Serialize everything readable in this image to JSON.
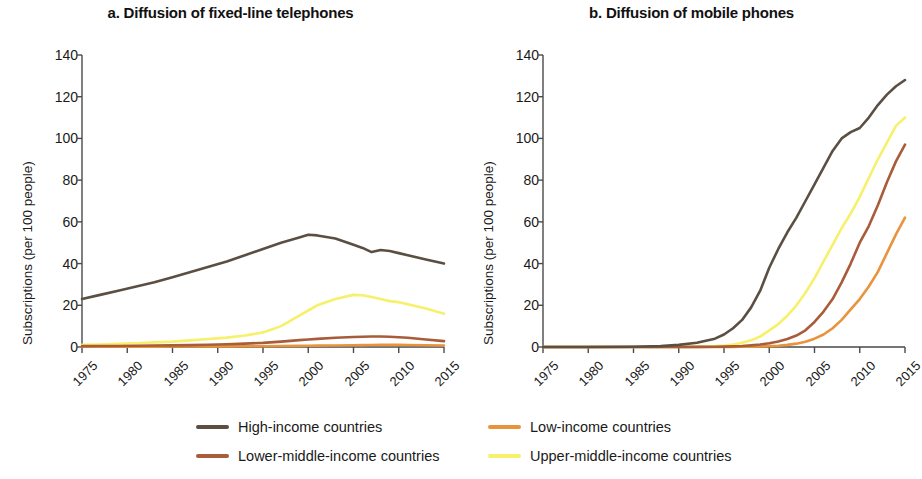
{
  "figure": {
    "ylabel": "Subscriptions (per 100 people)",
    "y_ticks": [
      "0",
      "20",
      "40",
      "60",
      "80",
      "100",
      "120",
      "140"
    ],
    "x_ticks": [
      "1975",
      "1980",
      "1985",
      "1990",
      "1995",
      "2000",
      "2005",
      "2010",
      "2015"
    ]
  },
  "panel_a": {
    "title": "a. Diffusion of fixed-line telephones"
  },
  "panel_b": {
    "title": "b. Diffusion of mobile phones"
  },
  "legend": {
    "items": [
      {
        "label": "High-income countries",
        "color": "#5a4f42"
      },
      {
        "label": "Low-income countries",
        "color": "#e8943c"
      },
      {
        "label": "Lower-middle-income countries",
        "color": "#a85c3a"
      },
      {
        "label": "Upper-middle-income countries",
        "color": "#f7f06a"
      }
    ]
  },
  "chart_data": [
    {
      "type": "line",
      "title": "a. Diffusion of fixed-line telephones",
      "xlabel": "",
      "ylabel": "Subscriptions (per 100 people)",
      "xlim": [
        1975,
        2015
      ],
      "ylim": [
        0,
        140
      ],
      "yticks": [
        0,
        20,
        40,
        60,
        80,
        100,
        120,
        140
      ],
      "xticks": [
        1975,
        1980,
        1985,
        1990,
        1995,
        2000,
        2005,
        2010,
        2015
      ],
      "grid": false,
      "legend_position": "below-figure",
      "x": [
        1975,
        1977,
        1979,
        1981,
        1983,
        1985,
        1987,
        1989,
        1991,
        1993,
        1995,
        1997,
        1999,
        2000,
        2001,
        2003,
        2005,
        2006,
        2007,
        2008,
        2009,
        2010,
        2011,
        2013,
        2015
      ],
      "series": [
        {
          "name": "High-income countries",
          "color": "#5a4f42",
          "values": [
            23,
            25,
            27,
            29,
            31,
            33.5,
            36,
            38.5,
            41,
            44,
            47,
            50,
            52.5,
            53.8,
            53.5,
            52,
            49,
            47.5,
            45.5,
            46.5,
            46,
            45,
            44,
            42,
            40
          ]
        },
        {
          "name": "Upper-middle-income countries",
          "color": "#f7f06a",
          "values": [
            1,
            1.2,
            1.5,
            1.8,
            2.2,
            2.6,
            3.2,
            3.8,
            4.5,
            5.5,
            7,
            10,
            15,
            17.5,
            20,
            23,
            25,
            24.8,
            24,
            23,
            22,
            21.5,
            20.5,
            18.5,
            16
          ]
        },
        {
          "name": "Lower-middle-income countries",
          "color": "#a85c3a",
          "values": [
            0.4,
            0.45,
            0.5,
            0.6,
            0.7,
            0.8,
            0.9,
            1.1,
            1.3,
            1.6,
            2,
            2.6,
            3.3,
            3.6,
            3.9,
            4.4,
            4.8,
            4.9,
            5,
            5,
            4.9,
            4.7,
            4.4,
            3.6,
            2.8
          ]
        },
        {
          "name": "Low-income countries",
          "color": "#e8943c",
          "values": [
            0.15,
            0.15,
            0.17,
            0.18,
            0.2,
            0.22,
            0.25,
            0.28,
            0.3,
            0.33,
            0.38,
            0.45,
            0.55,
            0.6,
            0.65,
            0.75,
            0.85,
            0.9,
            0.95,
            1,
            1,
            1,
            0.95,
            0.85,
            0.75
          ]
        }
      ]
    },
    {
      "type": "line",
      "title": "b. Diffusion of mobile phones",
      "xlabel": "",
      "ylabel": "Subscriptions (per 100 people)",
      "xlim": [
        1975,
        2015
      ],
      "ylim": [
        0,
        140
      ],
      "yticks": [
        0,
        20,
        40,
        60,
        80,
        100,
        120,
        140
      ],
      "xticks": [
        1975,
        1980,
        1985,
        1990,
        1995,
        2000,
        2005,
        2010,
        2015
      ],
      "grid": false,
      "legend_position": "below-figure",
      "x": [
        1975,
        1980,
        1985,
        1988,
        1990,
        1992,
        1994,
        1995,
        1996,
        1997,
        1998,
        1999,
        2000,
        2001,
        2002,
        2003,
        2004,
        2005,
        2006,
        2007,
        2008,
        2009,
        2010,
        2011,
        2012,
        2013,
        2014,
        2015
      ],
      "series": [
        {
          "name": "High-income countries",
          "color": "#5a4f42",
          "values": [
            0,
            0,
            0.1,
            0.4,
            1,
            2,
            4,
            6,
            9,
            13,
            19,
            27,
            38,
            47,
            55,
            62,
            70,
            78,
            86,
            94,
            100,
            103,
            105,
            110,
            116,
            121,
            125,
            128
          ]
        },
        {
          "name": "Upper-middle-income countries",
          "color": "#f7f06a",
          "values": [
            0,
            0,
            0,
            0,
            0.1,
            0.2,
            0.4,
            0.7,
            1.2,
            2,
            3.2,
            5,
            8,
            11,
            15,
            20,
            26,
            33,
            41,
            49,
            57,
            64,
            72,
            81,
            90,
            98,
            106,
            110
          ]
        },
        {
          "name": "Lower-middle-income countries",
          "color": "#a85c3a",
          "values": [
            0,
            0,
            0,
            0,
            0,
            0.05,
            0.1,
            0.2,
            0.3,
            0.5,
            0.8,
            1.2,
            1.8,
            2.6,
            3.8,
            5.5,
            8,
            12,
            17,
            23,
            31,
            40,
            50,
            58,
            68,
            79,
            89,
            97
          ]
        },
        {
          "name": "Low-income countries",
          "color": "#e8943c",
          "values": [
            0,
            0,
            0,
            0,
            0,
            0,
            0,
            0,
            0.05,
            0.1,
            0.15,
            0.25,
            0.4,
            0.6,
            1,
            1.6,
            2.5,
            4,
            6,
            9,
            13,
            18,
            23,
            29,
            36,
            45,
            54,
            62
          ]
        }
      ]
    }
  ]
}
